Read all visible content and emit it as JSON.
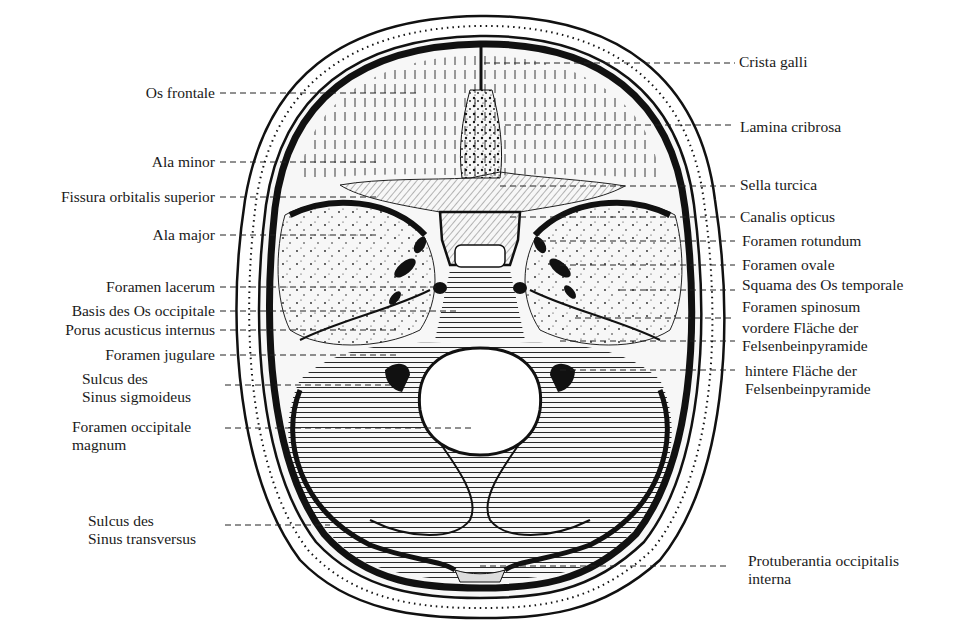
{
  "figure": {
    "colors": {
      "ink": "#111111",
      "paper": "#ffffff",
      "bone": "#f4f4f4"
    }
  },
  "labels_left": [
    {
      "id": "os-frontale",
      "lines": [
        "Os frontale"
      ]
    },
    {
      "id": "ala-minor",
      "lines": [
        "Ala minor"
      ]
    },
    {
      "id": "fissura-orbitalis-superior",
      "lines": [
        "Fissura orbitalis superior"
      ]
    },
    {
      "id": "ala-major",
      "lines": [
        "Ala major"
      ]
    },
    {
      "id": "foramen-lacerum",
      "lines": [
        "Foramen lacerum"
      ]
    },
    {
      "id": "basis-des-os-occipitale",
      "lines": [
        "Basis des Os occipitale"
      ]
    },
    {
      "id": "porus-acusticus-internus",
      "lines": [
        "Porus acusticus internus"
      ]
    },
    {
      "id": "foramen-jugulare",
      "lines": [
        "Foramen jugulare"
      ]
    },
    {
      "id": "sulcus-sinus-sigmoideus",
      "lines": [
        "Sulcus des",
        "Sinus sigmoideus"
      ]
    },
    {
      "id": "foramen-occipitale-magnum",
      "lines": [
        "Foramen occipitale",
        "magnum"
      ]
    },
    {
      "id": "sulcus-sinus-transversus",
      "lines": [
        "Sulcus des",
        "Sinus transversus"
      ]
    }
  ],
  "labels_right": [
    {
      "id": "crista-galli",
      "lines": [
        "Crista galli"
      ]
    },
    {
      "id": "lamina-cribrosa",
      "lines": [
        "Lamina cribrosa"
      ]
    },
    {
      "id": "sella-turcica",
      "lines": [
        "Sella turcica"
      ]
    },
    {
      "id": "canalis-opticus",
      "lines": [
        "Canalis opticus"
      ]
    },
    {
      "id": "foramen-rotundum",
      "lines": [
        "Foramen rotundum"
      ]
    },
    {
      "id": "foramen-ovale",
      "lines": [
        "Foramen ovale"
      ]
    },
    {
      "id": "squama-os-temporale",
      "lines": [
        "Squama des Os temporale"
      ]
    },
    {
      "id": "foramen-spinosum",
      "lines": [
        "Foramen spinosum"
      ]
    },
    {
      "id": "vordere-flaeche",
      "lines": [
        "vordere Fläche der",
        "Felsenbeinpyramide"
      ]
    },
    {
      "id": "hintere-flaeche",
      "lines": [
        "hintere Fläche der",
        "Felsenbeinpyramide"
      ]
    },
    {
      "id": "protuberantia-occipitalis-interna",
      "lines": [
        "Protuberantia occipitalis",
        "interna"
      ]
    }
  ]
}
